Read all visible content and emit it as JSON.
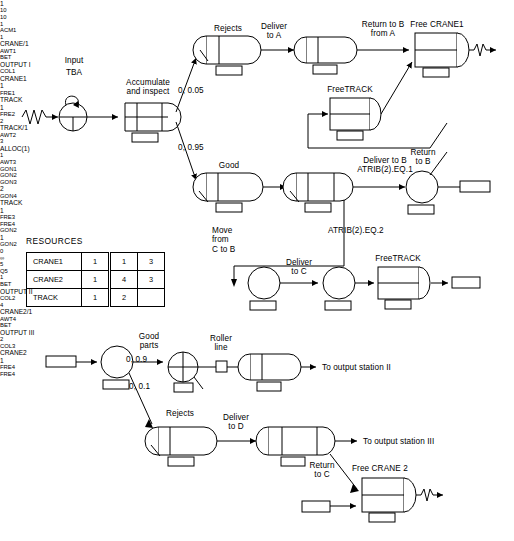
{
  "diagram": {
    "resources_title": "RESOURCES",
    "resources": {
      "rows": [
        {
          "name": "CRANE1",
          "c1": "1",
          "c2": "1",
          "c3": "3"
        },
        {
          "name": "CRANE2",
          "c1": "1",
          "c2": "4",
          "c3": "3"
        },
        {
          "name": "TRACK",
          "c1": "1",
          "c2": "2",
          "c3": ""
        }
      ]
    },
    "upper": {
      "input_label": "Input",
      "tba_label": "TBA",
      "create_num": "1",
      "accumulate_label": "Accumulate\nand inspect",
      "acc_first": "10",
      "acc_second": "10",
      "acc_m": "1",
      "acc_tag": "ACM1",
      "prob_reject": "0, 0.05",
      "prob_good": "0, 0.95",
      "rejects_label": "Rejects",
      "await1_q": "1",
      "await1_res": "CRANE/1",
      "await1_tag": "AWT1",
      "deliver_a_label": "Deliver\nto A",
      "col1_bet": "BET",
      "col1_name": "OUTPUT I",
      "col1_tag": "COL1",
      "return_b_from_a_label": "Return to B\nfrom A",
      "free1_label": "Free CRANE1",
      "free1_res": "CRANE1",
      "free1_num": "1",
      "free1_tag": "FRE1",
      "freetrack_label": "FreeTRACK",
      "fre2_res": "TRACK",
      "fre2_num": "1",
      "fre2_tag": "FRE2",
      "good_label": "Good",
      "await2_q": "2",
      "await2_res": "TRACK/1",
      "await2_tag": "AWT2",
      "await3_q": "3",
      "await3_res": "ALLOC(1)",
      "await3_m": "1",
      "await3_tag": "AWT3",
      "deliver_b_label": "Deliver to B\nATRIB(2).EQ.1",
      "return_b_label": "Return\nto B",
      "gon1_tag": "GON1",
      "gon2_box": "GON2",
      "atrib2_eq2_label": "ATRIB(2).EQ.2",
      "move_c_to_b_label": "Move\nfrom\nC to B",
      "gon3_tag": "GON3",
      "deliver_c_label": "Deliver\nto  C",
      "gon4_num": "2",
      "gon4_tag": "GON4",
      "freetrack2_label": "FreeTRACK",
      "fre3_res": "TRACK",
      "fre3_num": "1",
      "fre3_tag": "FRE3",
      "fre4_box": "FRE4"
    },
    "lower": {
      "gon2_in_box": "GON2",
      "goon_num": "1",
      "goon_tag": "GON2",
      "good_parts_label": "Good\nparts",
      "prob_good_parts": "0, 0.9",
      "prob_rejects": "0, 0.1",
      "queue_initial": "0",
      "queue_num": "5",
      "queue_cap": "∞",
      "queue_tag": "Q5",
      "roller_line_label": "Roller\nline",
      "roller_servers": "1",
      "col2_bet": "BET",
      "col2_name": "OUTPUT II",
      "col2_tag": "COL2",
      "to_station2_label": "To output station II",
      "rejects_label": "Rejects",
      "await4_q": "4",
      "await4_res": "CRANE2/1",
      "await4_tag": "AWT4",
      "deliver_d_label": "Deliver\nto  D",
      "col3_bet": "BET",
      "col3_name": "OUTPUT III",
      "col3_m": "2",
      "col3_tag": "COL3",
      "to_station3_label": "To output station III",
      "return_c_label": "Return\nto  C",
      "free_crane2_label": "Free CRANE 2",
      "fre4_res": "CRANE2",
      "fre4_num": "1",
      "fre4_tag": "FRE4",
      "fre4_in_box": "FRE4"
    }
  }
}
